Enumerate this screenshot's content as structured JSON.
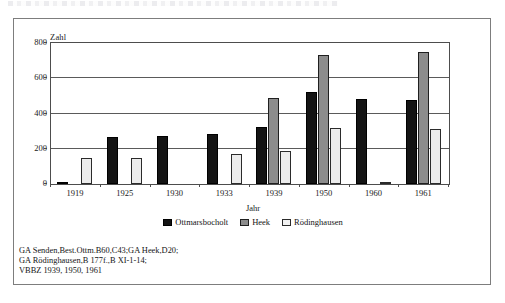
{
  "figure": {
    "y_axis_title": "Zahl",
    "x_axis_title": "Jahr"
  },
  "footnote": {
    "lines": [
      "GA Senden,Best.Ottm.B60,C43;GA Heek,D20;",
      "GA Rödinghausen,B 177f.,B XI-1-14;",
      "VBBZ 1939, 1950, 1961"
    ]
  },
  "colors": {
    "series_ottmarsbocholt": "#141414",
    "series_heek": "#8c8c8c",
    "series_roedinghausen": "#ececec",
    "frame": "#7d7d7d",
    "axis": "#4d4d4d"
  },
  "chart_data": {
    "type": "bar",
    "title": "",
    "subtitle": "",
    "xlabel": "Jahr",
    "ylabel": "Zahl",
    "ylim": [
      0,
      800
    ],
    "yticks": [
      0,
      200,
      400,
      600,
      800
    ],
    "ytick_labels": [
      "0",
      "200",
      "400",
      "600",
      "800"
    ],
    "grid": true,
    "grid_axis": "y",
    "legend_position": "bottom-center",
    "categories": [
      "1919",
      "1925",
      "1930",
      "1933",
      "1939",
      "1950",
      "1960",
      "1961"
    ],
    "series": [
      {
        "name": "Ottmarsbocholt",
        "color": "#141414",
        "values": [
          5,
          265,
          275,
          285,
          325,
          520,
          480,
          475
        ]
      },
      {
        "name": "Heek",
        "color": "#8c8c8c",
        "values": [
          0,
          0,
          0,
          0,
          490,
          730,
          0,
          750
        ]
      },
      {
        "name": "Rödinghausen",
        "color": "#ececec",
        "values": [
          150,
          150,
          0,
          170,
          185,
          315,
          5,
          310
        ]
      }
    ]
  }
}
